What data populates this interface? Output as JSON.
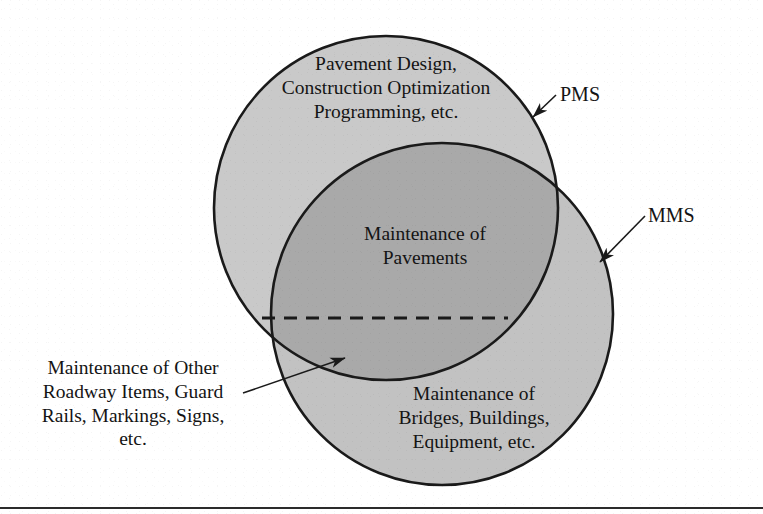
{
  "diagram": {
    "type": "venn",
    "title_labels": {
      "pms": "PMS",
      "mms": "MMS"
    },
    "regions": {
      "pms_only": "Pavement Design,\nConstruction Optimization\nProgramming, etc.",
      "intersection": "Maintenance of\nPavements",
      "mms_only": "Maintenance of\nBridges, Buildings,\nEquipment, etc.",
      "callout_other": "Maintenance of Other\nRoadway Items, Guard\nRails, Markings, Signs,\netc."
    },
    "colors": {
      "pms_fill": "#c9c9c9",
      "mms_fill": "#c2c2c2",
      "intersection_fill": "#a9a9a9",
      "outline": "#1a1a1a",
      "divider_line": "#1a1a1a",
      "background": "#ffffff"
    },
    "geometry": {
      "pms_circle": {
        "cx": 386,
        "cy": 208,
        "r": 172
      },
      "mms_circle": {
        "cx": 442,
        "cy": 314,
        "r": 171
      },
      "dashed_divider_y": 318,
      "dashed_divider_x_start": 262,
      "dashed_divider_x_end": 508
    }
  }
}
